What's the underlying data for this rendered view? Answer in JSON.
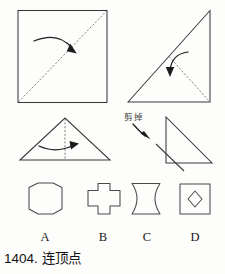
{
  "caption": {
    "number": "1404.",
    "text": "连顶点"
  },
  "annotations": {
    "cut_label": "剪掉"
  },
  "steps": [
    {
      "id": "step-1",
      "name": "square-fold",
      "shape": "square",
      "fold_line": "diagonal-bottom-left-to-top-right",
      "arrow": "fold-right-down"
    },
    {
      "id": "step-2",
      "name": "triangle-fold-vertex",
      "shape": "right-triangle",
      "fold_line": "hypotenuse-midpoint-to-right-angle",
      "arrow": "fold-down"
    },
    {
      "id": "step-3",
      "name": "isosceles-triangle-fold",
      "shape": "isosceles-triangle",
      "fold_line": "vertical-center",
      "arrow": "fold-left-to-right"
    },
    {
      "id": "step-4",
      "name": "cut-corner",
      "shape": "right-triangle",
      "cut_line": "diagonal-at-right-angle-corner",
      "arrow": "points-to-cut"
    }
  ],
  "options": [
    {
      "key": "A",
      "label": "A",
      "shape": "octagon-cut-corner-square"
    },
    {
      "key": "B",
      "label": "B",
      "shape": "plus-cross"
    },
    {
      "key": "C",
      "label": "C",
      "shape": "concave-four-point-star"
    },
    {
      "key": "D",
      "label": "D",
      "shape": "square-with-diamond-hole"
    }
  ],
  "colors": {
    "ink": "#3a3a3a",
    "dash": "#6b6b6b",
    "arrow": "#1d1d1d",
    "background": "#fdfdfc"
  }
}
